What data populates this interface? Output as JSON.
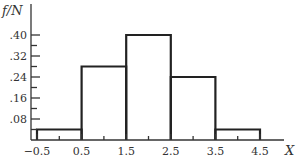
{
  "chart_data": {
    "type": "bar",
    "subtype": "histogram",
    "title": "",
    "xlabel": "X",
    "ylabel": "f/N",
    "bin_edges": [
      -0.5,
      0.5,
      1.5,
      2.5,
      3.5,
      4.5
    ],
    "categories": [
      "0",
      "1",
      "2",
      "3",
      "4"
    ],
    "values": [
      0.04,
      0.28,
      0.4,
      0.24,
      0.04
    ],
    "x_tick_labels": [
      "−0.5",
      "0.5",
      "1.5",
      "2.5",
      "3.5",
      "4.5"
    ],
    "x_ticks": [
      -0.5,
      0.5,
      1.5,
      2.5,
      3.5,
      4.5
    ],
    "y_tick_labels": [
      ".08",
      ".16",
      ".24",
      ".32",
      ".40"
    ],
    "y_ticks": [
      0.08,
      0.16,
      0.24,
      0.32,
      0.4
    ],
    "y_minor_step": 0.04,
    "xlim": [
      -0.65,
      5.1
    ],
    "ylim": [
      0,
      0.42
    ],
    "grid": false,
    "legend": null
  },
  "style": {
    "bar_stroke": "#222222",
    "axis_color": "#333333",
    "background": "#ffffff"
  }
}
